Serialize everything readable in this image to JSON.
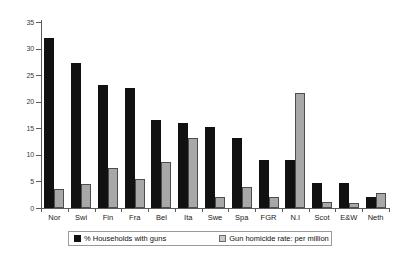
{
  "chart_data": {
    "type": "bar",
    "title": "",
    "subtitle": "",
    "xlabel": "",
    "ylabel": "",
    "ylim": [
      0,
      35
    ],
    "yticks": [
      0,
      5,
      10,
      15,
      20,
      25,
      30,
      35
    ],
    "grid": false,
    "legend_position": "bottom",
    "categories": [
      "Nor",
      "Swi",
      "Fin",
      "Fra",
      "Bel",
      "Ita",
      "Swe",
      "Spa",
      "FGR",
      "N.I",
      "Scot",
      "E&W",
      "Neth"
    ],
    "series": [
      {
        "name": "% Households with guns",
        "color": "#111111",
        "values": [
          32.0,
          27.2,
          23.2,
          22.6,
          16.6,
          16.0,
          15.2,
          13.2,
          9.0,
          9.0,
          4.7,
          4.7,
          2.0
        ]
      },
      {
        "name": "Gun homicide rate: per million",
        "color": "#a8a8a8",
        "values": [
          3.6,
          4.6,
          7.5,
          5.5,
          8.7,
          13.2,
          2.0,
          3.9,
          2.0,
          21.6,
          1.1,
          0.9,
          2.8
        ]
      }
    ]
  },
  "axis": {
    "y_tick_labels": [
      "35",
      "30",
      "25",
      "20",
      "15",
      "10",
      "5",
      "0"
    ]
  },
  "legend": {
    "entries": [
      {
        "label": "% Households with guns",
        "swatch": "black-square-icon"
      },
      {
        "label": "Gun homicide rate: per million",
        "swatch": "grey-square-icon"
      }
    ]
  }
}
